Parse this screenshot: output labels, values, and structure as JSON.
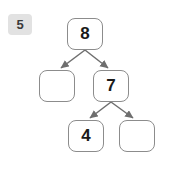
{
  "page": {
    "background_color": "#ffffff",
    "width": 178,
    "height": 177
  },
  "badge": {
    "label": "5",
    "background_color": "#e2e2e2",
    "text_color": "#3a3a3a"
  },
  "diagram": {
    "type": "binary-tree",
    "node_border_color": "#8c8c8c",
    "node_fill_color": "#ffffff",
    "edge_color": "#6e6e6e",
    "nodes": [
      {
        "id": "root",
        "label": "8",
        "empty": false,
        "x": 67,
        "y": 18,
        "row": 1
      },
      {
        "id": "left-child",
        "label": "",
        "empty": true,
        "x": 39,
        "y": 70,
        "row": 2
      },
      {
        "id": "right-child",
        "label": "7",
        "empty": false,
        "x": 93,
        "y": 70,
        "row": 2
      },
      {
        "id": "grand-left",
        "label": "4",
        "empty": false,
        "x": 68,
        "y": 120,
        "row": 3
      },
      {
        "id": "grand-right",
        "label": "",
        "empty": true,
        "x": 119,
        "y": 120,
        "row": 3
      }
    ],
    "edges": [
      {
        "from": "root",
        "to": "left-child",
        "arrow": true
      },
      {
        "from": "root",
        "to": "right-child",
        "arrow": true
      },
      {
        "from": "right-child",
        "to": "grand-left",
        "arrow": true
      },
      {
        "from": "right-child",
        "to": "grand-right",
        "arrow": true
      }
    ]
  }
}
